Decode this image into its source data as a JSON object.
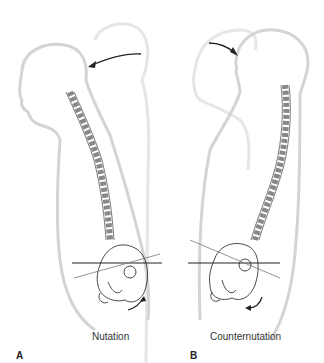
{
  "figure": {
    "panels": [
      {
        "letter": "A",
        "caption": "Nutation",
        "head_arrow_direction": "posterior-to-anterior (curving left)",
        "sacral_arrow_direction": "upward/anterior"
      },
      {
        "letter": "B",
        "caption": "Counternutation",
        "head_arrow_direction": "anterior-to-posterior (curving right)",
        "sacral_arrow_direction": "downward/posterior"
      }
    ],
    "colors": {
      "silhouette": "#d8d8d8",
      "bone_outline": "#333333",
      "reference_line": "#222222",
      "arrow": "#222222",
      "background": "#ffffff"
    }
  }
}
